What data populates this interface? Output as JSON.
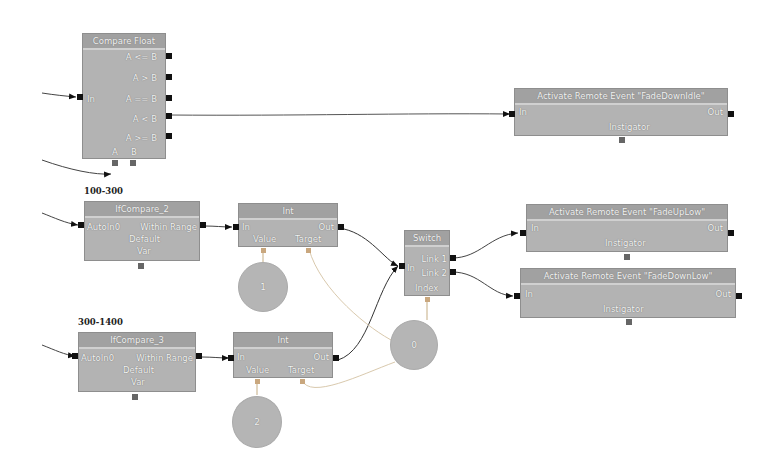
{
  "graph": {
    "compare_float": {
      "title": "Compare Float",
      "input": "In",
      "outputs": [
        "A <= B",
        "A > B",
        "A == B",
        "A < B",
        "A >= B"
      ],
      "bottom_ports": [
        "A",
        "B"
      ]
    },
    "event_fade_down_idle": {
      "title": "Activate Remote Event \"FadeDownIdle\"",
      "input": "In",
      "output": "Out",
      "bottom": "Instigator"
    },
    "group_label_1": "100-300",
    "group_label_2": "300-1400",
    "if_compare_2": {
      "title": "IfCompare_2",
      "row1_left": "AutoIn0",
      "row1_right": "Within Range",
      "row2": "Default",
      "row3": "Var"
    },
    "if_compare_3": {
      "title": "IfCompare_3",
      "row1_left": "AutoIn0",
      "row1_right": "Within Range",
      "row2": "Default",
      "row3": "Var"
    },
    "int_1": {
      "title": "Int",
      "input": "In",
      "output": "Out",
      "bottom_left": "Value",
      "bottom_right": "Target"
    },
    "int_2": {
      "title": "Int",
      "input": "In",
      "output": "Out",
      "bottom_left": "Value",
      "bottom_right": "Target"
    },
    "switch": {
      "title": "Switch",
      "input": "In",
      "outputs": [
        "Link 1",
        "Link 2"
      ],
      "bottom": "Index"
    },
    "event_fade_up_low": {
      "title": "Activate Remote Event \"FadeUpLow\"",
      "input": "In",
      "output": "Out",
      "bottom": "Instigator"
    },
    "event_fade_down_low": {
      "title": "Activate Remote Event \"FadeDownLow\"",
      "input": "In",
      "output": "Out",
      "bottom": "Instigator"
    },
    "variables": [
      {
        "value": "1"
      },
      {
        "value": "0"
      },
      {
        "value": "2"
      }
    ]
  },
  "colors": {
    "node_body": "#b3b3b3",
    "node_title": "#a1a1a1",
    "pin": "#111111",
    "wire": "#333333",
    "var_wire": "#d9c9ad"
  }
}
